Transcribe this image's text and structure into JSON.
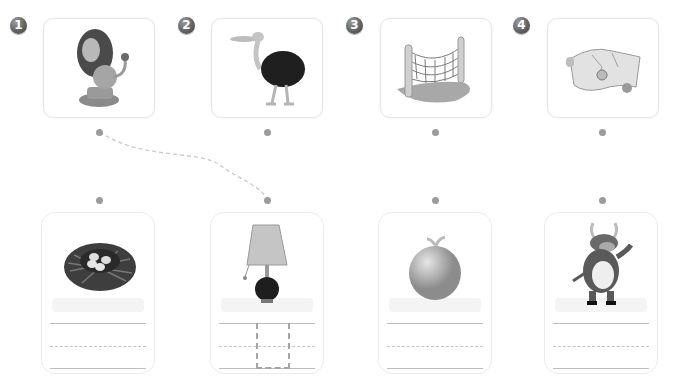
{
  "exercise": {
    "top_items": [
      {
        "number": "1",
        "picture": "lion"
      },
      {
        "number": "2",
        "picture": "ostrich"
      },
      {
        "number": "3",
        "picture": "net"
      },
      {
        "number": "4",
        "picture": "map"
      }
    ],
    "bottom_items": [
      {
        "picture": "nest"
      },
      {
        "picture": "lamp"
      },
      {
        "picture": "melon"
      },
      {
        "picture": "ox"
      }
    ],
    "connection": {
      "from": "top-1",
      "to": "bottom-2"
    }
  }
}
